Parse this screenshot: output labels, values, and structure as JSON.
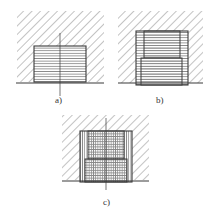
{
  "figure": {
    "colors": {
      "line": "#3a3a3a",
      "hatch": "#7a7a7a",
      "thread": "#8a8a8a",
      "background": "#ffffff"
    },
    "panels": [
      {
        "id": "a",
        "label": "a)"
      },
      {
        "id": "b",
        "label": "b)"
      },
      {
        "id": "c",
        "label": "c)"
      }
    ]
  }
}
